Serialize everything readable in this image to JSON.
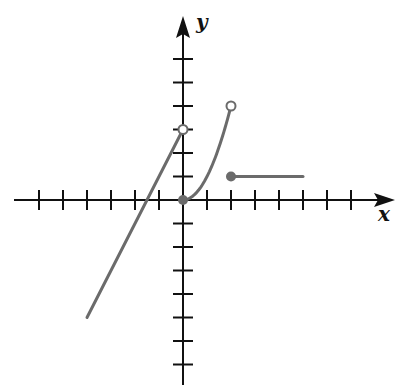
{
  "chart_data": {
    "type": "line",
    "title": "",
    "xlabel": "x",
    "ylabel": "y",
    "xlim": [
      -6,
      8
    ],
    "ylim": [
      -7,
      7
    ],
    "x_ticks": [
      -6,
      -5,
      -4,
      -3,
      -2,
      -1,
      1,
      2,
      3,
      4,
      5,
      6,
      7
    ],
    "y_ticks": [
      -7,
      -6,
      -5,
      -4,
      -3,
      -2,
      -1,
      1,
      2,
      3,
      4,
      5,
      6
    ],
    "grid": false,
    "legend": null,
    "series": [
      {
        "name": "linear piece",
        "formula": "y = 2x + 3",
        "domain": [
          -4,
          0
        ],
        "points": [
          [
            -4,
            -5
          ],
          [
            0,
            3
          ]
        ],
        "endpoints": [
          {
            "x": 0,
            "y": 3,
            "style": "open"
          }
        ]
      },
      {
        "name": "quadratic piece",
        "formula": "y = x^2",
        "domain": [
          0,
          2
        ],
        "points": [
          [
            0,
            0
          ],
          [
            0.5,
            0.25
          ],
          [
            1,
            1
          ],
          [
            1.5,
            2.25
          ],
          [
            2,
            4
          ]
        ],
        "endpoints": [
          {
            "x": 0,
            "y": 0,
            "style": "closed"
          },
          {
            "x": 2,
            "y": 4,
            "style": "open"
          }
        ]
      },
      {
        "name": "constant piece",
        "formula": "y = 1",
        "domain": [
          2,
          5
        ],
        "points": [
          [
            2,
            1
          ],
          [
            5,
            1
          ]
        ],
        "endpoints": [
          {
            "x": 2,
            "y": 1,
            "style": "closed"
          }
        ]
      }
    ]
  },
  "labels": {
    "x_axis": "x",
    "y_axis": "y"
  },
  "colors": {
    "axis": "#111111",
    "curve": "#6b6b6b"
  }
}
